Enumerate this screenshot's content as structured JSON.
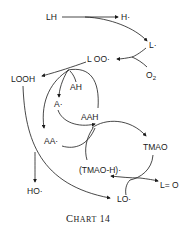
{
  "diagram": {
    "nodes": {
      "LH": "LH",
      "H_radical": "H·",
      "L_radical": "L·",
      "O2": "O",
      "O2_sub": "2",
      "LOO_radical": "L OO·",
      "LOOH": "LOOH",
      "AH": "AH",
      "A_radical": "A·",
      "AAH": "AAH",
      "AA_radical": "AA·",
      "TMAO": "TMAO",
      "TMAO_H_radical": "(TMAO-H)·",
      "HO_radical": "HO·",
      "LO_radical": "LO·",
      "L_eq_O": "L= O"
    },
    "caption": "Chart 14"
  }
}
